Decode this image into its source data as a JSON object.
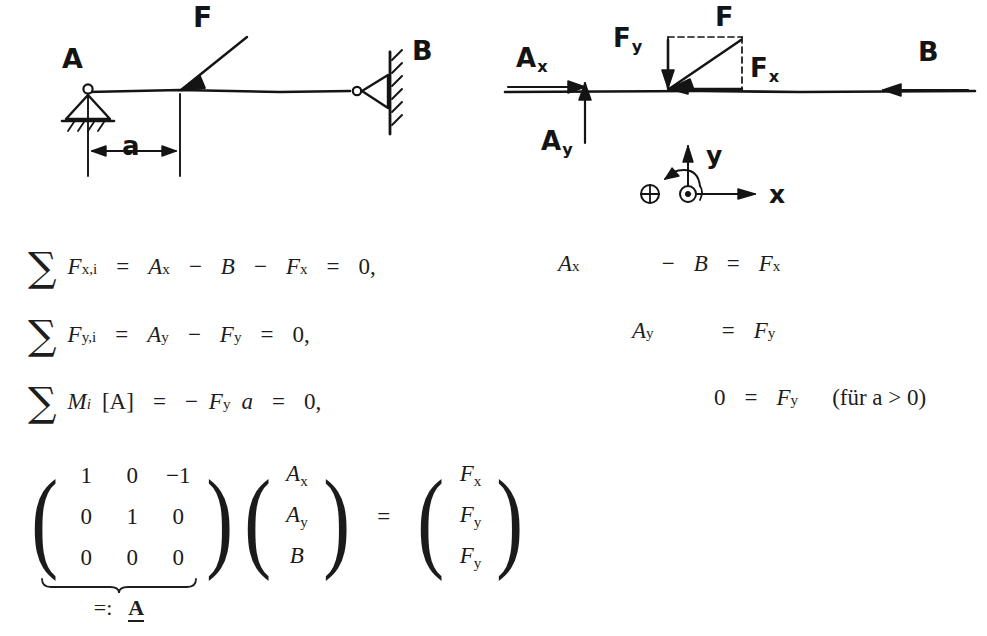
{
  "figure_left": {
    "name": "beam-sketch",
    "labels": {
      "support_a": "A",
      "support_b": "B",
      "force": "F",
      "distance": "a"
    }
  },
  "figure_right": {
    "name": "free-body-diagram",
    "labels": {
      "ax": "A",
      "ax_sub": "x",
      "ay": "A",
      "ay_sub": "y",
      "fy": "F",
      "fy_sub": "y",
      "fx": "F",
      "fx_sub": "x",
      "force": "F",
      "b": "B",
      "axis_y": "y",
      "axis_x": "x"
    },
    "icons": {
      "moment_symbol": "oplus-icon",
      "out_of_plane_symbol": "odot-icon"
    }
  },
  "equations": {
    "left": [
      {
        "sum": "∑",
        "lhs_main": "F",
        "lhs_sub": "x,i",
        "eq1": "=",
        "t1": "A",
        "t1_sub": "x",
        "op1": "−",
        "t2": "B",
        "op2": "−",
        "t3": "F",
        "t3_sub": "x",
        "eq2": "=",
        "rhs": "0",
        "comma": ","
      },
      {
        "sum": "∑",
        "lhs_main": "F",
        "lhs_sub": "y,i",
        "eq1": "=",
        "t1": "A",
        "t1_sub": "y",
        "op1": "−",
        "t2": "F",
        "t2_sub": "y",
        "eq2": "=",
        "rhs": "0",
        "comma": ","
      },
      {
        "sum": "∑",
        "lhs_main": "M",
        "lhs_sub": "i",
        "bracket": "[A]",
        "eq1": "=",
        "op1": "−",
        "t1": "F",
        "t1_sub": "y",
        "t2": "a",
        "eq2": "=",
        "rhs": "0",
        "comma": ","
      }
    ],
    "right": [
      {
        "t1": "A",
        "t1_sub": "x",
        "op": "−",
        "t2": "B",
        "eq": "=",
        "rhs": "F",
        "rhs_sub": "x"
      },
      {
        "t1": "A",
        "t1_sub": "y",
        "eq": "=",
        "rhs": "F",
        "rhs_sub": "y"
      },
      {
        "t1": "0",
        "eq": "=",
        "rhs": "F",
        "rhs_sub": "y",
        "note": "(für a > 0)"
      }
    ]
  },
  "matrix_equation": {
    "coefficients": [
      [
        "1",
        "0",
        "−1"
      ],
      [
        "0",
        "1",
        "0"
      ],
      [
        "0",
        "0",
        "0"
      ]
    ],
    "unknowns": [
      {
        "main": "A",
        "sub": "x"
      },
      {
        "main": "A",
        "sub": "y"
      },
      {
        "main": "B",
        "sub": ""
      }
    ],
    "equals": "=",
    "rhs": [
      {
        "main": "F",
        "sub": "x"
      },
      {
        "main": "F",
        "sub": "y"
      },
      {
        "main": "F",
        "sub": "y"
      }
    ],
    "underbrace_label_prefix": "=:",
    "underbrace_label_symbol": "A"
  },
  "colors": {
    "ink": "#1d1d1d",
    "sketch_ink": "#141414",
    "paper": "#ffffff"
  }
}
